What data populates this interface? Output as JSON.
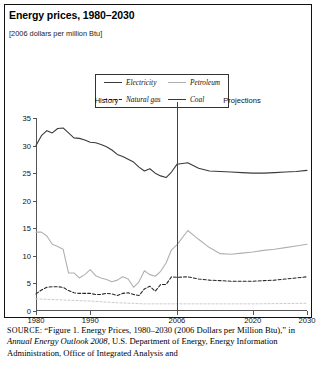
{
  "figure": {
    "title": "Energy prices, 1980–2030",
    "subtitle": "[2006 dollars per million Btu]",
    "source_prefix": "SOURCE",
    "source_part1": ": “Figure 1. Energy Prices, 1980–2030 (2006 Dollars per Million Btu),” in ",
    "source_italic": "Annual Energy Outlook 2008",
    "source_part2": ", U.S. Department of Energy, Energy Information Administration, Office of Integrated Analysis and"
  },
  "chart_data": {
    "type": "line",
    "title": "Energy prices, 1980–2030",
    "subtitle": "[2006 dollars per million Btu]",
    "xlabel": "",
    "ylabel": "2006 dollars per million Btu",
    "xlim": [
      1980,
      2030
    ],
    "ylim": [
      0,
      35
    ],
    "yticks": [
      0,
      5,
      10,
      15,
      20,
      25,
      30,
      35
    ],
    "xticks": [
      1980,
      1990,
      2006,
      2020,
      2030
    ],
    "grid": false,
    "legend_position": "top-center",
    "annotations": [
      {
        "text": "History",
        "x": 1993
      },
      {
        "text": "Projections",
        "x": 2018
      },
      {
        "text": "divider",
        "x": 2006
      }
    ],
    "colors": {
      "electricity": "#3a3a3a",
      "petroleum": "#b0b0b0",
      "natural_gas": "#262626",
      "coal": "#3a3a3a",
      "divider": "#444444",
      "axis": "#555555"
    },
    "series": [
      {
        "name": "Electricity",
        "style": "solid",
        "color": "#3a3a3a",
        "x": [
          1980,
          1981,
          1982,
          1983,
          1984,
          1985,
          1986,
          1987,
          1988,
          1989,
          1990,
          1991,
          1992,
          1993,
          1994,
          1995,
          1996,
          1997,
          1998,
          1999,
          2000,
          2001,
          2002,
          2003,
          2004,
          2005,
          2006,
          2008,
          2010,
          2012,
          2014,
          2016,
          2018,
          2020,
          2022,
          2024,
          2026,
          2028,
          2030
        ],
        "values": [
          30.0,
          31.8,
          32.7,
          32.3,
          33.1,
          33.2,
          32.3,
          31.4,
          31.3,
          31.0,
          30.6,
          30.5,
          30.2,
          29.8,
          29.2,
          28.4,
          28.0,
          27.5,
          27.0,
          26.1,
          25.4,
          25.8,
          25.0,
          24.5,
          24.2,
          25.2,
          26.6,
          26.9,
          25.9,
          25.4,
          25.3,
          25.2,
          25.1,
          25.0,
          25.0,
          25.1,
          25.2,
          25.3,
          25.5
        ]
      },
      {
        "name": "Petroleum",
        "style": "solid",
        "color": "#b0b0b0",
        "x": [
          1980,
          1981,
          1982,
          1983,
          1984,
          1985,
          1986,
          1987,
          1988,
          1989,
          1990,
          1991,
          1992,
          1993,
          1994,
          1995,
          1996,
          1997,
          1998,
          1999,
          2000,
          2001,
          2002,
          2003,
          2004,
          2005,
          2006,
          2008,
          2010,
          2012,
          2014,
          2016,
          2018,
          2020,
          2022,
          2024,
          2026,
          2028,
          2030
        ],
        "values": [
          14.3,
          14.3,
          13.6,
          12.1,
          11.7,
          11.2,
          6.9,
          6.9,
          6.0,
          6.6,
          7.5,
          6.4,
          6.0,
          5.7,
          5.3,
          5.6,
          6.2,
          5.8,
          4.3,
          5.3,
          7.3,
          6.6,
          6.3,
          7.2,
          8.7,
          11.1,
          12.0,
          14.6,
          13.0,
          11.5,
          10.4,
          10.3,
          10.5,
          10.7,
          11.0,
          11.2,
          11.5,
          11.8,
          12.1
        ]
      },
      {
        "name": "Natural gas",
        "style": "dashed",
        "color": "#262626",
        "x": [
          1980,
          1981,
          1982,
          1983,
          1984,
          1985,
          1986,
          1987,
          1988,
          1989,
          1990,
          1991,
          1992,
          1993,
          1994,
          1995,
          1996,
          1997,
          1998,
          1999,
          2000,
          2001,
          2002,
          2003,
          2004,
          2005,
          2006,
          2008,
          2010,
          2012,
          2014,
          2016,
          2018,
          2020,
          2022,
          2024,
          2026,
          2028,
          2030
        ],
        "values": [
          3.1,
          3.8,
          4.3,
          4.4,
          4.4,
          4.3,
          3.7,
          3.3,
          3.2,
          3.2,
          3.2,
          3.0,
          3.0,
          3.2,
          3.1,
          2.8,
          3.2,
          3.3,
          3.0,
          2.8,
          4.0,
          4.5,
          3.6,
          4.8,
          4.8,
          6.2,
          6.1,
          6.2,
          5.8,
          5.6,
          5.5,
          5.4,
          5.4,
          5.4,
          5.5,
          5.6,
          5.8,
          6.0,
          6.2
        ]
      },
      {
        "name": "Coal",
        "style": "solid",
        "color": "#cccccc",
        "x": [
          1980,
          1985,
          1990,
          1995,
          2000,
          2006,
          2010,
          2015,
          2020,
          2025,
          2030
        ],
        "values": [
          2.2,
          2.0,
          1.8,
          1.5,
          1.3,
          1.3,
          1.3,
          1.3,
          1.3,
          1.35,
          1.4
        ]
      }
    ]
  },
  "legend": {
    "items": [
      {
        "label": "Electricity",
        "style": "solid",
        "color": "#3a3a3a"
      },
      {
        "label": "Petroleum",
        "style": "solid",
        "color": "#b0b0b0"
      },
      {
        "label": "Natural gas",
        "style": "dashed",
        "color": "#262626"
      },
      {
        "label": "Coal",
        "style": "solid",
        "color": "#3a3a3a"
      }
    ]
  }
}
